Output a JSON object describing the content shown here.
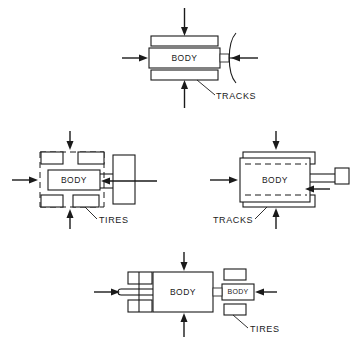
{
  "figure": {
    "title": "",
    "background_color": "#ffffff",
    "line_color": "#1a1a1a",
    "width": 356,
    "height": 358
  },
  "diagrams": [
    {
      "id": "top",
      "name": "tracked-vehicle-front-view",
      "body_label": "BODY",
      "callout_label": "TRACKS",
      "locomotion": "tracks",
      "arrows": [
        "top",
        "left",
        "right",
        "bottom"
      ],
      "has_deflector_arc": true
    },
    {
      "id": "middle-left",
      "name": "wheeled-vehicle-plan-view",
      "body_label": "BODY",
      "callout_label": "TIRES",
      "locomotion": "tires",
      "wheel_count": 4,
      "arrows": [
        "top",
        "left",
        "right",
        "bottom"
      ],
      "has_dashed_envelope": true
    },
    {
      "id": "middle-right",
      "name": "tracked-vehicle-plan-view",
      "body_label": "BODY",
      "callout_label": "TRACKS",
      "locomotion": "tracks",
      "arrows": [
        "top",
        "left",
        "right",
        "bottom"
      ],
      "has_dashed_envelope": true
    },
    {
      "id": "bottom",
      "name": "wheeled-vehicle-with-trailer",
      "body_label": "BODY",
      "secondary_body_label": "BODY",
      "callout_label": "TIRES",
      "locomotion": "tires",
      "wheel_count": 4,
      "arrows": [
        "top",
        "left",
        "right",
        "bottom"
      ]
    }
  ],
  "labels": {
    "body": "BODY",
    "tracks": "TRACKS",
    "tires": "TIRES"
  }
}
